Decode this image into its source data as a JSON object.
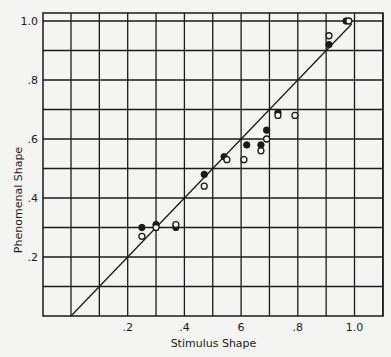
{
  "chart_data": {
    "type": "scatter",
    "title": "",
    "xlabel": "Stimulus Shape",
    "ylabel": "Phenomenal Shape",
    "xlim": [
      -0.1,
      1.1
    ],
    "ylim": [
      0.0,
      1.03
    ],
    "grid": true,
    "legend": null,
    "x_ticks": [
      {
        "value": 0.2,
        "label": ".2"
      },
      {
        "value": 0.4,
        "label": ".4"
      },
      {
        "value": 0.6,
        "label": "6"
      },
      {
        "value": 0.8,
        "label": ".8"
      },
      {
        "value": 1.0,
        "label": "1.0"
      }
    ],
    "y_ticks": [
      {
        "value": 0.2,
        "label": ".2"
      },
      {
        "value": 0.4,
        "label": ".4"
      },
      {
        "value": 0.6,
        "label": ".6"
      },
      {
        "value": 0.8,
        "label": ".8"
      },
      {
        "value": 1.0,
        "label": "1.0"
      }
    ],
    "reference_line": {
      "type": "identity",
      "from": [
        0.0,
        0.0
      ],
      "to": [
        0.99,
        0.99
      ]
    },
    "series": [
      {
        "name": "filled",
        "marker": "filled-circle",
        "points": [
          [
            0.25,
            0.3
          ],
          [
            0.3,
            0.31
          ],
          [
            0.37,
            0.3
          ],
          [
            0.47,
            0.48
          ],
          [
            0.54,
            0.54
          ],
          [
            0.62,
            0.58
          ],
          [
            0.67,
            0.58
          ],
          [
            0.69,
            0.63
          ],
          [
            0.73,
            0.69
          ],
          [
            0.91,
            0.92
          ],
          [
            0.97,
            1.0
          ]
        ]
      },
      {
        "name": "open",
        "marker": "open-circle",
        "points": [
          [
            0.25,
            0.27
          ],
          [
            0.3,
            0.3
          ],
          [
            0.37,
            0.31
          ],
          [
            0.47,
            0.44
          ],
          [
            0.55,
            0.53
          ],
          [
            0.61,
            0.53
          ],
          [
            0.67,
            0.56
          ],
          [
            0.69,
            0.6
          ],
          [
            0.73,
            0.68
          ],
          [
            0.79,
            0.68
          ],
          [
            0.91,
            0.95
          ],
          [
            0.98,
            1.0
          ]
        ]
      }
    ]
  },
  "labels": {
    "xlabel": "Stimulus Shape",
    "ylabel": "Phenomenal Shape"
  }
}
